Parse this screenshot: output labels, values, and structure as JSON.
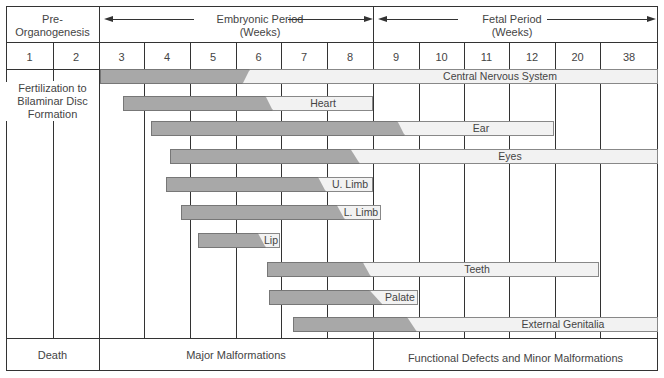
{
  "header": {
    "pre_organogenesis": "Pre-\nOrganogenesis",
    "pre_line1": "Pre-",
    "pre_line2": "Organogenesis",
    "embryonic_line1": "Embryonic Period",
    "embryonic_line2": "(Weeks)",
    "fetal_line1": "Fetal Period",
    "fetal_line2": "(Weeks)"
  },
  "weeks": [
    "1",
    "2",
    "3",
    "4",
    "5",
    "6",
    "7",
    "8",
    "9",
    "10",
    "11",
    "12",
    "20",
    "38"
  ],
  "pre_note": {
    "line1": "Fertilization to",
    "line2": "Bilaminar Disc",
    "line3": "Formation"
  },
  "bars": [
    {
      "label": "Central Nervous System",
      "start_week": 3,
      "dark_end_week": 6,
      "end_week": 38
    },
    {
      "label": "Heart",
      "start_week": 3.5,
      "dark_end_week": 6.5,
      "end_week": 8
    },
    {
      "label": "Ear",
      "start_week": 4,
      "dark_end_week": 9.5,
      "end_week": 12
    },
    {
      "label": "Eyes",
      "start_week": 4.5,
      "dark_end_week": 8.5,
      "end_week": 38
    },
    {
      "label": "U. Limb",
      "start_week": 4.5,
      "dark_end_week": 7.5,
      "end_week": 8
    },
    {
      "label": "L. Limb",
      "start_week": 4.5,
      "dark_end_week": 8,
      "end_week": 8.5
    },
    {
      "label": "Lip",
      "start_week": 5,
      "dark_end_week": 6,
      "end_week": 6
    },
    {
      "label": "Teeth",
      "start_week": 6.5,
      "dark_end_week": 8.5,
      "end_week": 20
    },
    {
      "label": "Palate",
      "start_week": 6.5,
      "dark_end_week": 8.5,
      "end_week": 9
    },
    {
      "label": "External Genitalia",
      "start_week": 7,
      "dark_end_week": 9.5,
      "end_week": 38
    }
  ],
  "footer": {
    "death": "Death",
    "major": "Major Malformations",
    "minor": "Functional Defects and Minor Malformations"
  },
  "colors": {
    "critical_period": "#a8a8a8",
    "less_sensitive_period": "#f2f2f2",
    "lines": "#333333"
  }
}
